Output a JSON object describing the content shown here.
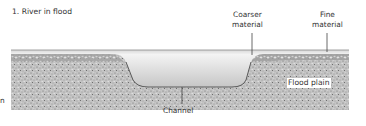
{
  "figure": {
    "title": "1. River in flood",
    "labels": {
      "coarser_material": [
        "Coarser",
        "material"
      ],
      "fine_material": [
        "Fine",
        "material"
      ],
      "flood_plain": "Flood plain",
      "channel": "Channel",
      "cropped_left_char": "n"
    }
  },
  "colors": {
    "sediment": "#b8b8b8",
    "water_top": "#f2f2f2",
    "water_bottom": "#c9c9c9",
    "surface_band": "#a8a8a8",
    "leader_line": "#444444"
  }
}
